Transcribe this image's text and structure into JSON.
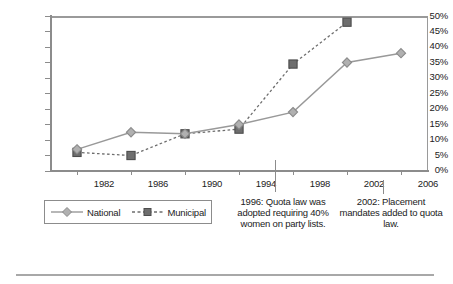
{
  "chart_data": {
    "type": "line",
    "title": "",
    "subtitle": "",
    "xlabel": "",
    "ylabel": "",
    "x": [
      1982,
      1986,
      1990,
      1994,
      1998,
      2002,
      2006
    ],
    "categories": [
      "1982",
      "1986",
      "1990",
      "1994",
      "1998",
      "2002",
      "2006"
    ],
    "xlim": [
      1980,
      2008
    ],
    "ylim": [
      0,
      50
    ],
    "ytick_labels": [
      "0%",
      "5%",
      "10%",
      "15%",
      "20%",
      "25%",
      "30%",
      "35%",
      "40%",
      "45%",
      "50%"
    ],
    "ytick_values": [
      0,
      5,
      10,
      15,
      20,
      25,
      30,
      35,
      40,
      45,
      50
    ],
    "grid": false,
    "legend_position": "bottom-left",
    "series": [
      {
        "name": "National",
        "marker": "diamond",
        "linestyle": "solid",
        "color": "#999999",
        "x": [
          1982,
          1986,
          1990,
          1994,
          1998,
          2002,
          2006
        ],
        "values": [
          7,
          12.5,
          12,
          15,
          19,
          35,
          38
        ]
      },
      {
        "name": "Municipal",
        "marker": "square",
        "linestyle": "dashed",
        "color": "#6e6e6e",
        "x": [
          1982,
          1986,
          1990,
          1994,
          1998,
          2002
        ],
        "values": [
          6,
          5,
          12,
          13.5,
          34.5,
          48
        ]
      }
    ],
    "annotations": [
      {
        "id": "ann-1996",
        "year": 1996,
        "text": "1996:  Quota law was adopted requiring 40% women on party lists."
      },
      {
        "id": "ann-2002",
        "year": 2002,
        "text": "2002:  Placement mandates added to quota law."
      }
    ]
  },
  "legend": {
    "items": [
      {
        "label": "National"
      },
      {
        "label": "Municipal"
      }
    ]
  },
  "axes": {
    "y": {
      "t50": "50%",
      "t45": "45%",
      "t40": "40%",
      "t35": "35%",
      "t30": "30%",
      "t25": "25%",
      "t20": "20%",
      "t15": "15%",
      "t10": "10%",
      "t5": "5%",
      "t0": "0%"
    },
    "x": {
      "t1982": "1982",
      "t1986": "1986",
      "t1990": "1990",
      "t1994": "1994",
      "t1998": "1998",
      "t2002": "2002",
      "t2006": "2006"
    }
  },
  "annotations": {
    "quota_1996": "1996:  Quota law was adopted requiring 40% women on party lists.",
    "placement_2002": "2002:  Placement mandates added to quota law."
  },
  "colors": {
    "national": "#999999",
    "municipal": "#6e6e6e",
    "axis": "#8c8c8c",
    "text": "#222222"
  }
}
